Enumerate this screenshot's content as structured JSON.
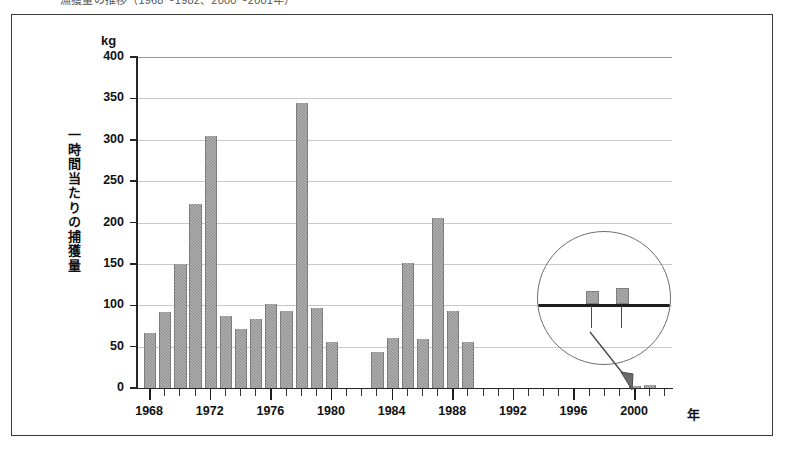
{
  "figure": {
    "caption_clipped": "漁獲量の推移（1968〜1982、2000〜2001年）"
  },
  "axes": {
    "y_unit": "kg",
    "y_title": "一時間当たりの捕獲量",
    "x_title": "年",
    "y_ticks": [
      "400",
      "350",
      "300",
      "250",
      "200",
      "150",
      "100",
      "50",
      "0"
    ],
    "x_ticks": [
      "1968",
      "1972",
      "1976",
      "1980",
      "1984",
      "1988",
      "1992",
      "1996",
      "2000"
    ]
  },
  "inset": {
    "name": "magnified-detail",
    "bar_count": 2
  },
  "colors": {
    "bar_fill": "#8d8d8d",
    "axis": "#262626",
    "grid": "#c9c9c9",
    "frame": "#3a3a3a"
  },
  "chart_data": {
    "type": "bar",
    "title": "一時間当たりの捕獲量",
    "xlabel": "年",
    "ylabel": "一時間当たりの捕獲量",
    "yunit": "kg",
    "ylim": [
      0,
      400
    ],
    "xlim": [
      1967.2,
      2002.5
    ],
    "grid": true,
    "legend": null,
    "categories": [
      1968,
      1969,
      1970,
      1971,
      1972,
      1973,
      1974,
      1975,
      1976,
      1977,
      1978,
      1979,
      1980,
      1981,
      1982,
      1983,
      1984,
      1985,
      1986,
      1987,
      1988,
      1989,
      1990,
      1991,
      1992,
      1993,
      1994,
      1995,
      1996,
      1997,
      1998,
      1999,
      2000,
      2001
    ],
    "values": [
      67,
      92,
      150,
      222,
      305,
      87,
      71,
      84,
      101,
      93,
      345,
      97,
      56,
      null,
      null,
      43,
      60,
      151,
      59,
      206,
      93,
      56,
      null,
      null,
      null,
      null,
      null,
      null,
      null,
      null,
      null,
      null,
      3,
      4
    ]
  }
}
